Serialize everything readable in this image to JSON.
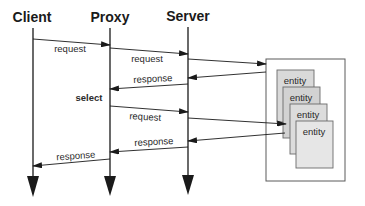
{
  "diagram": {
    "type": "sequence",
    "actors": [
      {
        "id": "client",
        "label": "Client",
        "x": 33
      },
      {
        "id": "proxy",
        "label": "Proxy",
        "x": 110
      },
      {
        "id": "server",
        "label": "Server",
        "x": 188
      }
    ],
    "messages": [
      {
        "from": "client",
        "to": "proxy",
        "label": "request"
      },
      {
        "from": "proxy",
        "to": "server",
        "label": "request"
      },
      {
        "from": "server",
        "to": "entity-store",
        "label": ""
      },
      {
        "from": "entity-store",
        "to": "server",
        "label": ""
      },
      {
        "from": "server",
        "to": "proxy",
        "label": "response"
      },
      {
        "from": "proxy",
        "to": "server",
        "label": "request"
      },
      {
        "from": "server",
        "to": "entity-store",
        "label": ""
      },
      {
        "from": "entity-store",
        "to": "server",
        "label": ""
      },
      {
        "from": "server",
        "to": "proxy",
        "label": "response"
      },
      {
        "from": "proxy",
        "to": "client",
        "label": "response"
      }
    ],
    "annotations": [
      {
        "label": "select",
        "near": "proxy"
      }
    ],
    "entity_store": {
      "entities": [
        "entity",
        "entity",
        "entity",
        "entity"
      ]
    }
  },
  "colors": {
    "line": "#1a1a1a",
    "container_border": "#555555",
    "entity_fill_1": "#d9d9d9",
    "entity_fill_2": "#d4d4d4",
    "entity_fill_3": "#dcdcdc",
    "entity_fill_4": "#e6e6e6"
  }
}
